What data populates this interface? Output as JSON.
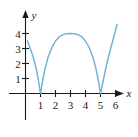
{
  "chart_data": {
    "type": "line",
    "title": "",
    "subtitle": "",
    "xlabel": "x",
    "ylabel": "y",
    "xlim": [
      -0.55,
      6.85
    ],
    "ylim": [
      -0.85,
      5.2
    ],
    "grid": false,
    "legend": null,
    "x_ticks": [
      1,
      2,
      3,
      4,
      5,
      6
    ],
    "x_tick_labels": [
      "1",
      "2",
      "3",
      "4",
      "5",
      "6"
    ],
    "y_ticks": [
      1,
      2,
      3,
      4
    ],
    "y_tick_labels": [
      "1",
      "2",
      "3",
      "4"
    ],
    "curve_color": "#73b4d2",
    "axis_color": "#1a1a1a",
    "background_color": "#ffffff",
    "series": [
      {
        "name": "y = |(x-1)(x-5)|",
        "description": "absolute value parabola touching zero at x=1 and x=5 with peak 4 at x=3",
        "roots": [
          1,
          5
        ],
        "peak": {
          "x": 3,
          "y": 4
        },
        "y_intercept": 3.5,
        "points": [
          {
            "x": 0.12,
            "y": 3.52
          },
          {
            "x": 0.25,
            "y": 3.19
          },
          {
            "x": 0.4,
            "y": 2.76
          },
          {
            "x": 0.55,
            "y": 2.3
          },
          {
            "x": 0.7,
            "y": 1.72
          },
          {
            "x": 0.85,
            "y": 0.95
          },
          {
            "x": 1.0,
            "y": 0.0
          },
          {
            "x": 1.15,
            "y": 0.9
          },
          {
            "x": 1.3,
            "y": 1.64
          },
          {
            "x": 1.5,
            "y": 2.4
          },
          {
            "x": 1.75,
            "y": 3.05
          },
          {
            "x": 2.0,
            "y": 3.5
          },
          {
            "x": 2.25,
            "y": 3.78
          },
          {
            "x": 2.5,
            "y": 3.92
          },
          {
            "x": 2.75,
            "y": 3.99
          },
          {
            "x": 3.0,
            "y": 4.0
          },
          {
            "x": 3.25,
            "y": 3.99
          },
          {
            "x": 3.5,
            "y": 3.92
          },
          {
            "x": 3.75,
            "y": 3.78
          },
          {
            "x": 4.0,
            "y": 3.5
          },
          {
            "x": 4.25,
            "y": 3.05
          },
          {
            "x": 4.5,
            "y": 2.4
          },
          {
            "x": 4.7,
            "y": 1.64
          },
          {
            "x": 4.85,
            "y": 0.9
          },
          {
            "x": 5.0,
            "y": 0.0
          },
          {
            "x": 5.2,
            "y": 0.95
          },
          {
            "x": 5.4,
            "y": 1.9
          },
          {
            "x": 5.6,
            "y": 2.7
          },
          {
            "x": 5.8,
            "y": 3.45
          },
          {
            "x": 6.0,
            "y": 4.2
          },
          {
            "x": 6.1,
            "y": 4.6
          }
        ]
      }
    ]
  },
  "axes": {
    "x_axis_label": "x",
    "y_axis_label": "y"
  }
}
